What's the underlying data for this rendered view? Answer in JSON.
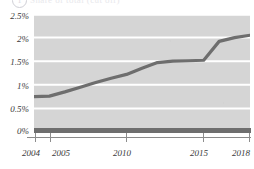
{
  "header": {
    "badge": "1",
    "title": "Share of total (cut off)"
  },
  "chart_data": {
    "type": "line",
    "title": "",
    "xlabel": "",
    "ylabel": "",
    "grid": true,
    "legend": "none",
    "line_color": "#6e6e6e",
    "plot_background": "#d5d5d5",
    "gridline_color": "#ffffff",
    "xlim": [
      2004,
      2018
    ],
    "ylim": [
      0,
      2.5
    ],
    "y_ticks": [
      "0%",
      "0.5%",
      "1%",
      "1.5%",
      "2%",
      "2.5%"
    ],
    "y_tick_values": [
      0,
      0.5,
      1,
      1.5,
      2,
      2.5
    ],
    "x_ticks": [
      "2004",
      "2005",
      "2010",
      "2015",
      "2018"
    ],
    "x_tick_values": [
      2004,
      2005,
      2010,
      2015,
      2018
    ],
    "x": [
      2004,
      2005,
      2006,
      2007,
      2008,
      2009,
      2010,
      2011,
      2012,
      2013,
      2014,
      2015,
      2016,
      2017,
      2018
    ],
    "values": [
      0.75,
      0.76,
      0.85,
      0.95,
      1.05,
      1.14,
      1.22,
      1.35,
      1.47,
      1.5,
      1.51,
      1.52,
      1.92,
      2.0,
      2.05
    ],
    "series": [
      {
        "name": "share",
        "values": [
          0.75,
          0.76,
          0.85,
          0.95,
          1.05,
          1.14,
          1.22,
          1.35,
          1.47,
          1.5,
          1.51,
          1.52,
          1.92,
          2.0,
          2.05
        ]
      }
    ]
  }
}
